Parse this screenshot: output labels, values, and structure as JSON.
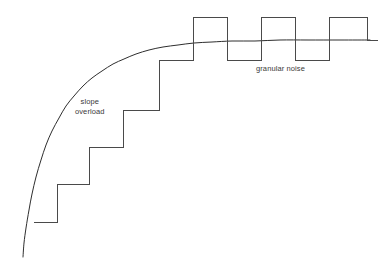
{
  "figure": {
    "background_color": "#ffffff",
    "width": 386,
    "height": 259
  },
  "annotations": {
    "slope_overload": {
      "line1": "slope",
      "line2": "overload",
      "x": 75,
      "y": 97
    },
    "granular_noise": {
      "text": "granular noise",
      "x": 256,
      "y": 64
    }
  },
  "style": {
    "staircase_color": "#4a4a4a",
    "curve_color": "#2e2e2e",
    "text_color": "#3a3a3a",
    "stroke_width": 1
  },
  "chart_data": {
    "type": "line",
    "xlabel": "",
    "ylabel": "",
    "grid": false,
    "legend": "none",
    "xlim": [
      0,
      386
    ],
    "ylim": [
      259,
      0
    ],
    "series": [
      {
        "name": "analog-input-curve",
        "description": "Exponentially rising analog message signal that saturates toward a flat asymptote",
        "color": "#2e2e2e",
        "points": [
          [
            23,
            257
          ],
          [
            24,
            243
          ],
          [
            26,
            228
          ],
          [
            29,
            210
          ],
          [
            32,
            194
          ],
          [
            36,
            177
          ],
          [
            41,
            160
          ],
          [
            46,
            145
          ],
          [
            52,
            131
          ],
          [
            59,
            118
          ],
          [
            66,
            106
          ],
          [
            74,
            96
          ],
          [
            83,
            86
          ],
          [
            92,
            78
          ],
          [
            102,
            71
          ],
          [
            113,
            64
          ],
          [
            124,
            59
          ],
          [
            136,
            54
          ],
          [
            149,
            50
          ],
          [
            163,
            47
          ],
          [
            178,
            45
          ],
          [
            194,
            43
          ],
          [
            212,
            42
          ],
          [
            232,
            41
          ],
          [
            255,
            41
          ],
          [
            280,
            40
          ],
          [
            308,
            40
          ],
          [
            340,
            40
          ],
          [
            370,
            40
          ]
        ]
      },
      {
        "name": "delta-modulator-staircase",
        "description": "Quantized staircase output of the delta modulator; constant step size cannot track the steep rise (slope overload) and hunts about the flat region (granular noise)",
        "color": "#4a4a4a",
        "step_size": 37,
        "points": [
          [
            34,
            222
          ],
          [
            57,
            222
          ],
          [
            57,
            184
          ],
          [
            89,
            184
          ],
          [
            89,
            147
          ],
          [
            123,
            147
          ],
          [
            123,
            110
          ],
          [
            159,
            110
          ],
          [
            159,
            60
          ],
          [
            193,
            60
          ],
          [
            193,
            17
          ],
          [
            227,
            17
          ],
          [
            227,
            60
          ],
          [
            261,
            60
          ],
          [
            261,
            17
          ],
          [
            295,
            17
          ],
          [
            295,
            60
          ],
          [
            329,
            60
          ],
          [
            329,
            17
          ],
          [
            367,
            17
          ],
          [
            367,
            40
          ],
          [
            378,
            40
          ]
        ]
      }
    ],
    "regions": [
      {
        "name": "slope-overload",
        "label": "slope overload",
        "x_range": [
          34,
          159
        ],
        "note": "Staircase lags behind the fast-rising analog curve"
      },
      {
        "name": "granular-noise",
        "label": "granular noise",
        "x_range": [
          193,
          378
        ],
        "note": "Staircase oscillates one step above and below the flat analog level"
      }
    ]
  }
}
